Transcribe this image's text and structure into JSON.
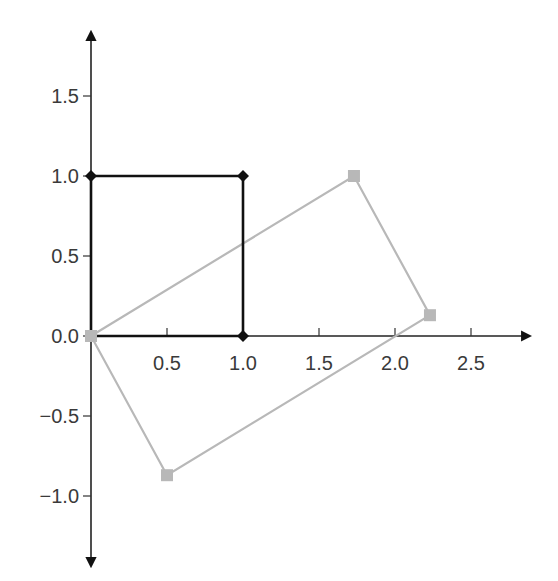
{
  "chart_data": {
    "type": "scatter",
    "title": "",
    "xlabel": "",
    "ylabel": "",
    "xlim": [
      0,
      2.9
    ],
    "ylim": [
      -1.3,
      1.85
    ],
    "grid": false,
    "legend": null,
    "x_ticks": [
      "0.5",
      "1.0",
      "1.5",
      "2.0",
      "2.5"
    ],
    "y_ticks": [
      "1.5",
      "1.0",
      "0.5",
      "0.0",
      "−0.5",
      "−1.0"
    ],
    "series": [
      {
        "name": "unit square",
        "color": "#111111",
        "marker": "diamond",
        "closed": true,
        "points": [
          [
            0,
            0
          ],
          [
            1.0,
            0
          ],
          [
            1.0,
            1.0
          ],
          [
            0,
            1.0
          ]
        ]
      },
      {
        "name": "transformed rectangle",
        "color": "#b8b8b8",
        "marker": "square",
        "closed": true,
        "points": [
          [
            0,
            0
          ],
          [
            1.73,
            1.0
          ],
          [
            2.23,
            0.13
          ],
          [
            0.5,
            -0.87
          ]
        ]
      }
    ]
  }
}
